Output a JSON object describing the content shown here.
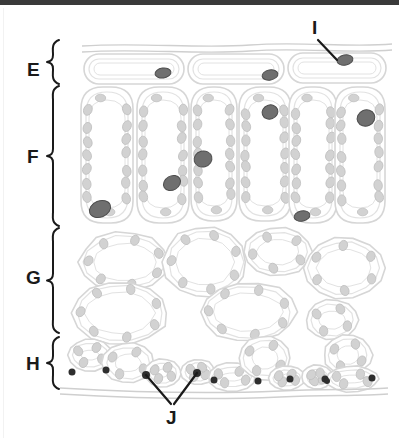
{
  "figure": {
    "kind": "leaf-cross-section-diagram",
    "title": "",
    "width": 399,
    "height": 440,
    "background": "#ffffff",
    "top_bar_color": "#3a3a3a",
    "colors": {
      "cell_wall": "#d6d6d6",
      "cell_wall_inner": "#e2e2e2",
      "chloroplast": "#d2d2d2",
      "chloroplast_stroke": "#c0c0c0",
      "nucleus_dark": "#6f6f6f",
      "nucleus_dark_stroke": "#4d4d4d",
      "guard_dot": "#2e2e2e",
      "cuticle": "#cfcfcf",
      "label_text": "#1a1a1a",
      "leader_line": "#1a1a1a"
    }
  },
  "brace_labels": [
    {
      "id": "E",
      "text": "E",
      "label_x": 27,
      "label_y": 60,
      "brace_x": 50,
      "brace_top": 40,
      "brace_bottom": 84
    },
    {
      "id": "F",
      "text": "F",
      "label_x": 27,
      "label_y": 147,
      "brace_x": 50,
      "brace_top": 86,
      "brace_bottom": 226
    },
    {
      "id": "G",
      "text": "G",
      "label_x": 26,
      "label_y": 268,
      "brace_x": 50,
      "brace_top": 228,
      "brace_bottom": 333
    },
    {
      "id": "H",
      "text": "H",
      "label_x": 26,
      "label_y": 354,
      "brace_x": 50,
      "brace_top": 337,
      "brace_bottom": 389
    }
  ],
  "pointer_labels": [
    {
      "id": "I",
      "text": "I",
      "label_x": 312,
      "label_y": 18,
      "leaders": [
        {
          "x1": 318,
          "y1": 40,
          "x2": 337,
          "y2": 60
        }
      ]
    },
    {
      "id": "J",
      "text": "J",
      "label_x": 166,
      "label_y": 408,
      "leaders": [
        {
          "x1": 171,
          "y1": 404,
          "x2": 146,
          "y2": 375
        },
        {
          "x1": 174,
          "y1": 404,
          "x2": 197,
          "y2": 373
        }
      ]
    }
  ],
  "cuticle_lines": {
    "top": [
      "M 82 46 C 140 42, 200 49, 250 45 C 300 41, 350 48, 392 44",
      "M 82 52 C 140 48, 200 55, 250 51 C 300 47, 350 54, 392 50"
    ],
    "bottom": [
      "M 60 388 C 130 392, 210 394, 280 391 C 330 389, 360 390, 388 388",
      "M 60 394 C 130 398, 210 400, 280 397 C 330 395, 360 396, 388 394"
    ]
  },
  "layers": [
    {
      "id": "E",
      "name": "upper-epidermis",
      "cells": [
        {
          "shape": "rect",
          "x": 84,
          "y": 54,
          "w": 100,
          "h": 30,
          "rx": 15
        },
        {
          "shape": "rect",
          "x": 188,
          "y": 54,
          "w": 96,
          "h": 30,
          "rx": 15
        },
        {
          "shape": "rect",
          "x": 288,
          "y": 53,
          "w": 98,
          "h": 30,
          "rx": 15
        }
      ],
      "nuclei": [
        {
          "cx": 163,
          "cy": 73,
          "rx": 8,
          "ry": 5,
          "rot": -8
        },
        {
          "cx": 270,
          "cy": 75,
          "rx": 8,
          "ry": 5,
          "rot": -10
        },
        {
          "cx": 345,
          "cy": 60,
          "rx": 8,
          "ry": 5,
          "rot": -12
        }
      ]
    },
    {
      "id": "F",
      "name": "palisade-mesophyll",
      "cells": [
        {
          "shape": "palisade",
          "x": 80,
          "y": 86,
          "w": 54,
          "h": 138
        },
        {
          "shape": "palisade",
          "x": 136,
          "y": 86,
          "w": 54,
          "h": 138
        },
        {
          "shape": "palisade",
          "x": 190,
          "y": 86,
          "w": 48,
          "h": 136
        },
        {
          "shape": "palisade",
          "x": 238,
          "y": 86,
          "w": 54,
          "h": 136
        },
        {
          "shape": "palisade",
          "x": 288,
          "y": 86,
          "w": 50,
          "h": 138
        },
        {
          "shape": "palisade",
          "x": 334,
          "y": 86,
          "w": 52,
          "h": 138
        }
      ],
      "nuclei": [
        {
          "cx": 100,
          "cy": 209,
          "rx": 11,
          "ry": 8,
          "rot": -22
        },
        {
          "cx": 172,
          "cy": 183,
          "rx": 9,
          "ry": 7,
          "rot": -30
        },
        {
          "cx": 203,
          "cy": 159,
          "rx": 9,
          "ry": 8,
          "rot": -15
        },
        {
          "cx": 270,
          "cy": 112,
          "rx": 8,
          "ry": 7,
          "rot": -20
        },
        {
          "cx": 302,
          "cy": 216,
          "rx": 8,
          "ry": 5,
          "rot": -12
        },
        {
          "cx": 366,
          "cy": 118,
          "rx": 9,
          "ry": 8,
          "rot": -25
        }
      ]
    },
    {
      "id": "G",
      "name": "spongy-mesophyll",
      "cells": [
        {
          "shape": "blob",
          "cx": 125,
          "cy": 262,
          "rx": 45,
          "ry": 30
        },
        {
          "shape": "blob",
          "cx": 205,
          "cy": 262,
          "rx": 42,
          "ry": 35
        },
        {
          "shape": "blob",
          "cx": 278,
          "cy": 252,
          "rx": 34,
          "ry": 24
        },
        {
          "shape": "blob",
          "cx": 344,
          "cy": 268,
          "rx": 40,
          "ry": 30
        },
        {
          "shape": "blob",
          "cx": 120,
          "cy": 313,
          "rx": 48,
          "ry": 32
        },
        {
          "shape": "blob",
          "cx": 248,
          "cy": 312,
          "rx": 48,
          "ry": 30
        },
        {
          "shape": "blob",
          "cx": 332,
          "cy": 320,
          "rx": 26,
          "ry": 20
        }
      ]
    },
    {
      "id": "H",
      "name": "lower-epidermis",
      "cells": [
        {
          "shape": "blob",
          "cx": 90,
          "cy": 355,
          "rx": 22,
          "ry": 16
        },
        {
          "shape": "blob",
          "cx": 128,
          "cy": 363,
          "rx": 26,
          "ry": 20
        },
        {
          "shape": "blob",
          "cx": 163,
          "cy": 373,
          "rx": 18,
          "ry": 14
        },
        {
          "shape": "blob",
          "cx": 198,
          "cy": 372,
          "rx": 17,
          "ry": 13
        },
        {
          "shape": "blob",
          "cx": 232,
          "cy": 377,
          "rx": 24,
          "ry": 14
        },
        {
          "shape": "blob",
          "cx": 265,
          "cy": 358,
          "rx": 26,
          "ry": 22
        },
        {
          "shape": "blob",
          "cx": 287,
          "cy": 378,
          "rx": 18,
          "ry": 12
        },
        {
          "shape": "blob",
          "cx": 317,
          "cy": 377,
          "rx": 15,
          "ry": 12
        },
        {
          "shape": "blob",
          "cx": 348,
          "cy": 355,
          "rx": 24,
          "ry": 20
        },
        {
          "shape": "blob",
          "cx": 352,
          "cy": 379,
          "rx": 26,
          "ry": 13
        }
      ],
      "guard_dots": [
        {
          "cx": 72,
          "cy": 372,
          "r": 3.5
        },
        {
          "cx": 106,
          "cy": 370,
          "r": 3.5
        },
        {
          "cx": 146,
          "cy": 375,
          "r": 4
        },
        {
          "cx": 197,
          "cy": 373,
          "r": 4
        },
        {
          "cx": 214,
          "cy": 380,
          "r": 3.5
        },
        {
          "cx": 258,
          "cy": 381,
          "r": 3.5
        },
        {
          "cx": 290,
          "cy": 379,
          "r": 3.5
        },
        {
          "cx": 325,
          "cy": 379,
          "r": 3.5
        },
        {
          "cx": 327,
          "cy": 381,
          "r": 3
        },
        {
          "cx": 372,
          "cy": 378,
          "r": 3.5
        }
      ]
    }
  ]
}
